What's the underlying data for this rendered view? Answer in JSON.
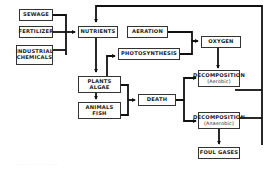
{
  "diagram": {
    "nodes": {
      "sewage": {
        "label": "SEWAGE"
      },
      "fertilizer": {
        "label": "FERTILIZER"
      },
      "industrial": {
        "line1": "INDUSTRIAL",
        "line2": "CHEMICALS"
      },
      "nutrients": {
        "label": "NUTRIENTS"
      },
      "aeration": {
        "label": "AERATION"
      },
      "photosynthesis": {
        "label": "PHOTOSYNTHESIS"
      },
      "oxygen": {
        "label": "OXYGEN"
      },
      "plants": {
        "line1": "PLANTS",
        "line2": "ALGAE"
      },
      "animals": {
        "line1": "ANIMALS",
        "line2": "FISH"
      },
      "death": {
        "label": "DEATH"
      },
      "decomp_aerobic": {
        "line1": "DECOMPOSITION",
        "line2": "(Aerobic)"
      },
      "decomp_anaerobic": {
        "line1": "DECOMPOSITION",
        "line2": "(Anaerobic)"
      },
      "foul_gases": {
        "label": "FOUL GASES"
      }
    },
    "edges": [
      [
        "SEWAGE",
        "NUTRIENTS"
      ],
      [
        "FERTILIZER",
        "NUTRIENTS"
      ],
      [
        "INDUSTRIAL CHEMICALS",
        "NUTRIENTS"
      ],
      [
        "NUTRIENTS",
        "PLANTS ALGAE"
      ],
      [
        "PLANTS ALGAE",
        "PHOTOSYNTHESIS"
      ],
      [
        "PLANTS ALGAE",
        "ANIMALS FISH"
      ],
      [
        "PLANTS ALGAE",
        "DEATH"
      ],
      [
        "ANIMALS FISH",
        "DEATH"
      ],
      [
        "AERATION",
        "OXYGEN"
      ],
      [
        "PHOTOSYNTHESIS",
        "OXYGEN"
      ],
      [
        "OXYGEN",
        "DECOMPOSITION (Aerobic)"
      ],
      [
        "DEATH",
        "DECOMPOSITION (Aerobic)"
      ],
      [
        "DEATH",
        "DECOMPOSITION (Anaerobic)"
      ],
      [
        "DECOMPOSITION (Aerobic)",
        "NUTRIENTS"
      ],
      [
        "DECOMPOSITION (Anaerobic)",
        "NUTRIENTS"
      ],
      [
        "DECOMPOSITION (Anaerobic)",
        "FOUL GASES"
      ]
    ],
    "caption": "· · · · · · · · · · · · · · · ·"
  }
}
